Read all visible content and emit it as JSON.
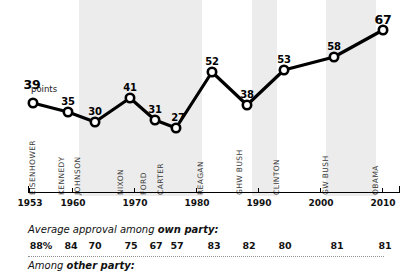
{
  "chart_data": {
    "type": "line",
    "title": "",
    "xlabel": "",
    "ylabel": "",
    "categories": [
      "EISENHOWER",
      "KENNEDY",
      "JOHNSON",
      "NIXON",
      "FORD",
      "CARTER",
      "REAGAN",
      "GHW BUSH",
      "CLINTON",
      "GW BUSH",
      "OBAMA"
    ],
    "values": [
      39,
      35,
      30,
      41,
      31,
      27,
      52,
      38,
      53,
      58,
      67
    ],
    "point_labels": [
      "39",
      "35",
      "30",
      "41",
      "31",
      "27",
      "52",
      "38",
      "53",
      "58",
      "67"
    ],
    "unit_note": "points",
    "x": [
      1953,
      1961,
      1964,
      1969,
      1974,
      1977,
      1981,
      1989,
      1993,
      2001,
      2009
    ],
    "xlim": [
      1953,
      2013
    ],
    "ylim": [
      20,
      72
    ],
    "xticks": [
      "1953",
      "1960",
      "1970",
      "1980",
      "1990",
      "2000",
      "2010"
    ],
    "xtick_values": [
      1953,
      1960,
      1970,
      1980,
      1990,
      2000,
      2010
    ],
    "grid": false,
    "legend": "none",
    "marker": "open-circle",
    "line_color": "#000000",
    "band_color": "#ececec",
    "shaded_bands": [
      {
        "from": 1961,
        "to": 1969
      },
      {
        "from": 1969,
        "to": 1977
      },
      {
        "from": 1977,
        "to": 1981
      },
      {
        "from": 1989,
        "to": 1993
      },
      {
        "from": 2001,
        "to": 2009
      }
    ]
  },
  "series_points": [
    {
      "name": "EISENHOWER",
      "value": "39",
      "x": 33,
      "y": 103,
      "emphasis": true,
      "label_dx": -1,
      "label_dy": -26
    },
    {
      "name": "KENNEDY",
      "value": "35",
      "x": 68,
      "y": 112,
      "emphasis": false,
      "label_dx": 0,
      "label_dy": -16
    },
    {
      "name": "JOHNSON",
      "value": "30",
      "x": 95,
      "y": 122,
      "emphasis": false,
      "label_dx": 0,
      "label_dy": -16
    },
    {
      "name": "NIXON",
      "value": "41",
      "x": 130,
      "y": 98,
      "emphasis": false,
      "label_dx": 0,
      "label_dy": -16
    },
    {
      "name": "FORD",
      "value": "31",
      "x": 155,
      "y": 120,
      "emphasis": false,
      "label_dx": 0,
      "label_dy": -16
    },
    {
      "name": "CARTER",
      "value": "27",
      "x": 176,
      "y": 128,
      "emphasis": false,
      "label_dx": 2,
      "label_dy": -16
    },
    {
      "name": "REAGAN",
      "value": "52",
      "x": 212,
      "y": 72,
      "emphasis": false,
      "label_dx": 0,
      "label_dy": -16
    },
    {
      "name": "GHW BUSH",
      "value": "38",
      "x": 247,
      "y": 105,
      "emphasis": false,
      "label_dx": 0,
      "label_dy": -16
    },
    {
      "name": "CLINTON",
      "value": "53",
      "x": 284,
      "y": 70,
      "emphasis": false,
      "label_dx": 0,
      "label_dy": -16
    },
    {
      "name": "GW BUSH",
      "value": "58",
      "x": 334,
      "y": 57,
      "emphasis": false,
      "label_dx": 0,
      "label_dy": -16
    },
    {
      "name": "OBAMA",
      "value": "67",
      "x": 383,
      "y": 30,
      "emphasis": true,
      "label_dx": 0,
      "label_dy": -18
    }
  ],
  "president_labels": [
    {
      "label": "EISENHOWER",
      "x": 40,
      "bottom": 186
    },
    {
      "label": "KENNEDY",
      "x": 69,
      "bottom": 186
    },
    {
      "label": "JOHNSON",
      "x": 85,
      "bottom": 186
    },
    {
      "label": "NIXON",
      "x": 128,
      "bottom": 186
    },
    {
      "label": "FORD",
      "x": 151,
      "bottom": 186
    },
    {
      "label": "CARTER",
      "x": 168,
      "bottom": 186
    },
    {
      "label": "REAGAN",
      "x": 208,
      "bottom": 186
    },
    {
      "label": "GHW BUSH",
      "x": 247,
      "bottom": 186
    },
    {
      "label": "CLINTON",
      "x": 284,
      "bottom": 186
    },
    {
      "label": "GW BUSH",
      "x": 333,
      "bottom": 186
    },
    {
      "label": "OBAMA",
      "x": 383,
      "bottom": 186
    }
  ],
  "axis": {
    "ticks": [
      {
        "label": "1953",
        "x": 29
      },
      {
        "label": "1960",
        "x": 72
      },
      {
        "label": "1970",
        "x": 134
      },
      {
        "label": "1980",
        "x": 196
      },
      {
        "label": "1990",
        "x": 258
      },
      {
        "label": "2000",
        "x": 320
      },
      {
        "label": "2010",
        "x": 382
      }
    ]
  },
  "footer": {
    "own_party": {
      "title_prefix": "Average approval among ",
      "title_bold": "own party:",
      "values": [
        "88%",
        "84",
        "70",
        "75",
        "67",
        "57",
        "83",
        "82",
        "80",
        "81",
        "81"
      ],
      "x": [
        41,
        71,
        95,
        131,
        156,
        177,
        214,
        249,
        285,
        337,
        385
      ]
    },
    "other_party": {
      "title_prefix": "Among ",
      "title_bold": "other party:"
    }
  }
}
